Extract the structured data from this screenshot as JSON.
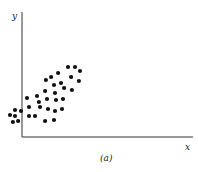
{
  "chart_data": {
    "type": "scatter",
    "title": "",
    "caption": "(a)",
    "xlabel": "x",
    "ylabel": "y",
    "grid": false,
    "ticks": false,
    "xlim": [
      0,
      100
    ],
    "ylim": [
      0,
      100
    ],
    "note": "Unitless scatter; values estimated in 0-100 axis units from pixel positions. Points with negative x lie left of the y-axis.",
    "points": [
      {
        "x": -7.0,
        "y": 17.6
      },
      {
        "x": -4.1,
        "y": 21.6
      },
      {
        "x": -4.1,
        "y": 16.8
      },
      {
        "x": -5.3,
        "y": 12.0
      },
      {
        "x": -2.3,
        "y": 12.8
      },
      {
        "x": -0.6,
        "y": 20.8
      },
      {
        "x": 2.9,
        "y": 31.2
      },
      {
        "x": 4.1,
        "y": 24.0
      },
      {
        "x": 4.1,
        "y": 16.8
      },
      {
        "x": 7.6,
        "y": 16.8
      },
      {
        "x": 8.8,
        "y": 32.8
      },
      {
        "x": 9.9,
        "y": 28.0
      },
      {
        "x": 10.5,
        "y": 24.0
      },
      {
        "x": 13.5,
        "y": 12.8
      },
      {
        "x": 18.7,
        "y": 13.6
      },
      {
        "x": 13.5,
        "y": 36.8
      },
      {
        "x": 14.6,
        "y": 30.4
      },
      {
        "x": 15.2,
        "y": 22.4
      },
      {
        "x": 14.0,
        "y": 45.6
      },
      {
        "x": 17.0,
        "y": 48.0
      },
      {
        "x": 18.7,
        "y": 41.6
      },
      {
        "x": 19.3,
        "y": 35.2
      },
      {
        "x": 19.9,
        "y": 29.6
      },
      {
        "x": 19.3,
        "y": 20.8
      },
      {
        "x": 21.1,
        "y": 51.2
      },
      {
        "x": 22.8,
        "y": 43.2
      },
      {
        "x": 24.6,
        "y": 39.2
      },
      {
        "x": 24.0,
        "y": 30.4
      },
      {
        "x": 23.4,
        "y": 22.4
      },
      {
        "x": 26.9,
        "y": 56.0
      },
      {
        "x": 28.7,
        "y": 48.0
      },
      {
        "x": 29.2,
        "y": 37.6
      },
      {
        "x": 31.0,
        "y": 56.0
      },
      {
        "x": 33.9,
        "y": 52.8
      },
      {
        "x": 33.3,
        "y": 44.8
      }
    ]
  }
}
